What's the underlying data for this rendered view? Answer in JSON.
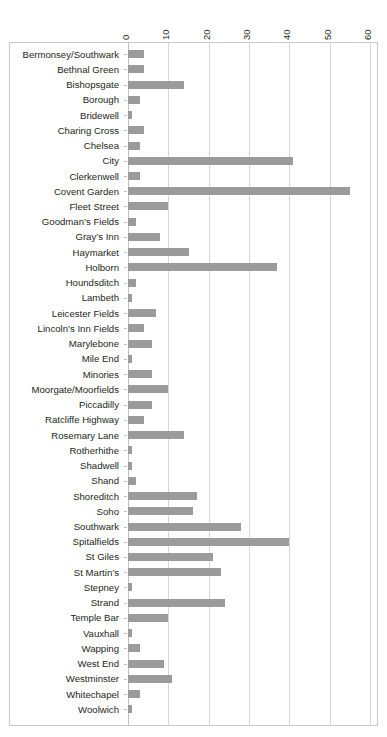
{
  "chart_data": {
    "type": "bar",
    "orientation": "horizontal",
    "title": "",
    "subtitle": "",
    "xlabel": "",
    "ylabel": "",
    "xlim": [
      0,
      60
    ],
    "xticks": [
      0,
      10,
      20,
      30,
      40,
      50,
      60
    ],
    "xtick_labels": [
      "0",
      "10",
      "20",
      "30",
      "40",
      "50",
      "60"
    ],
    "grid": true,
    "legend": false,
    "bar_color": "#9b9b9b",
    "gridline_color": "#d6d6d6",
    "frame_color": "#c9c9c9",
    "categories": [
      "Bermonsey/Southwark",
      "Bethnal Green",
      "Bishopsgate",
      "Borough",
      "Bridewell",
      "Charing Cross",
      "Chelsea",
      "City",
      "Clerkenwell",
      "Covent Garden",
      "Fleet Street",
      "Goodman’s Fields",
      "Gray’s Inn",
      "Haymarket",
      "Holborn",
      "Houndsditch",
      "Lambeth",
      "Leicester Fields",
      "Lincoln’s Inn Fields",
      "Marylebone",
      "Mile End",
      "Minories",
      "Moorgate/Moorfields",
      "Piccadilly",
      "Ratcliffe Highway",
      "Rosemary Lane",
      "Rotherhithe",
      "Shadwell",
      "Shand",
      "Shoreditch",
      "Soho",
      "Southwark",
      "Spitalfields",
      "St Giles",
      "St Martin’s",
      "Stepney",
      "Strand",
      "Temple Bar",
      "Vauxhall",
      "Wapping",
      "West End",
      "Westminster",
      "Whitechapel",
      "Woolwich"
    ],
    "values": [
      4,
      4,
      14,
      3,
      1,
      4,
      3,
      41,
      3,
      55,
      10,
      2,
      8,
      15,
      37,
      2,
      1,
      7,
      4,
      6,
      1,
      6,
      10,
      6,
      4,
      14,
      1,
      1,
      2,
      17,
      16,
      28,
      40,
      21,
      23,
      1,
      24,
      10,
      1,
      3,
      9,
      11,
      3,
      1
    ]
  }
}
